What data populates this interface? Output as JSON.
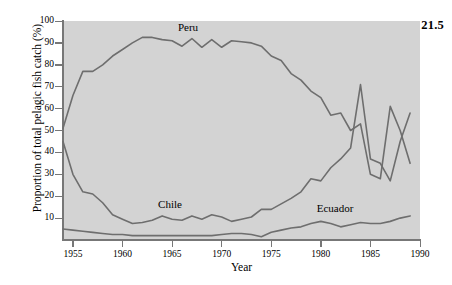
{
  "figure": {
    "number": "21.5"
  },
  "chart_data": {
    "type": "line",
    "title": "",
    "xlabel": "Year",
    "ylabel": "Proportion of total pelagic fish catch (%)",
    "xlim": [
      1954,
      1990
    ],
    "ylim": [
      0,
      100
    ],
    "xticks": [
      1955,
      1960,
      1965,
      1970,
      1975,
      1980,
      1985,
      1990
    ],
    "yticks": [
      0,
      10,
      20,
      30,
      40,
      50,
      60,
      70,
      80,
      90,
      100
    ],
    "ytick_labels": [
      "",
      "10",
      "20",
      "30",
      "40",
      "50",
      "60",
      "70",
      "80",
      "90",
      "100"
    ],
    "grid": false,
    "legend_position": "inline-annotations",
    "plot_background": "#d3d3d3",
    "line_color": "#6e6e6e",
    "annotations": [
      {
        "text": "Peru",
        "x": 1967,
        "y": 97
      },
      {
        "text": "Chile",
        "x": 1965,
        "y": 16
      },
      {
        "text": "Ecuador",
        "x": 1981,
        "y": 14
      }
    ],
    "x": [
      1954,
      1955,
      1956,
      1957,
      1958,
      1959,
      1960,
      1961,
      1962,
      1963,
      1964,
      1965,
      1966,
      1967,
      1968,
      1969,
      1970,
      1971,
      1972,
      1973,
      1974,
      1975,
      1976,
      1977,
      1978,
      1979,
      1980,
      1981,
      1982,
      1983,
      1984,
      1985,
      1986,
      1987,
      1988,
      1989
    ],
    "series": [
      {
        "name": "Peru",
        "values": [
          51,
          66,
          77,
          77,
          80,
          84,
          87,
          90,
          92.5,
          92.5,
          91.5,
          91,
          88.5,
          92,
          88,
          91.5,
          88,
          91,
          90.5,
          90,
          88.5,
          84,
          82,
          76,
          73,
          68,
          65,
          57,
          58,
          50,
          53,
          30,
          28,
          61,
          50,
          35
        ]
      },
      {
        "name": "Chile",
        "values": [
          45,
          30,
          22,
          21,
          17,
          11.5,
          9.5,
          7.5,
          8,
          9,
          11,
          9.5,
          9,
          11,
          9.5,
          11.5,
          10.5,
          8.5,
          9.5,
          10.5,
          14,
          14,
          16.5,
          19,
          22,
          28,
          27,
          33,
          37,
          42,
          71,
          37,
          35,
          27,
          45,
          58
        ]
      },
      {
        "name": "Ecuador",
        "values": [
          5,
          4.5,
          4,
          3.5,
          3,
          2.5,
          2.5,
          2,
          2,
          2,
          2,
          2,
          2,
          2,
          2,
          2,
          2.5,
          3,
          3,
          2.5,
          1.5,
          3.5,
          4.5,
          5.5,
          6,
          7.5,
          8.5,
          7.5,
          6,
          7,
          8,
          7.5,
          7.5,
          8.5,
          10,
          11
        ]
      }
    ]
  }
}
